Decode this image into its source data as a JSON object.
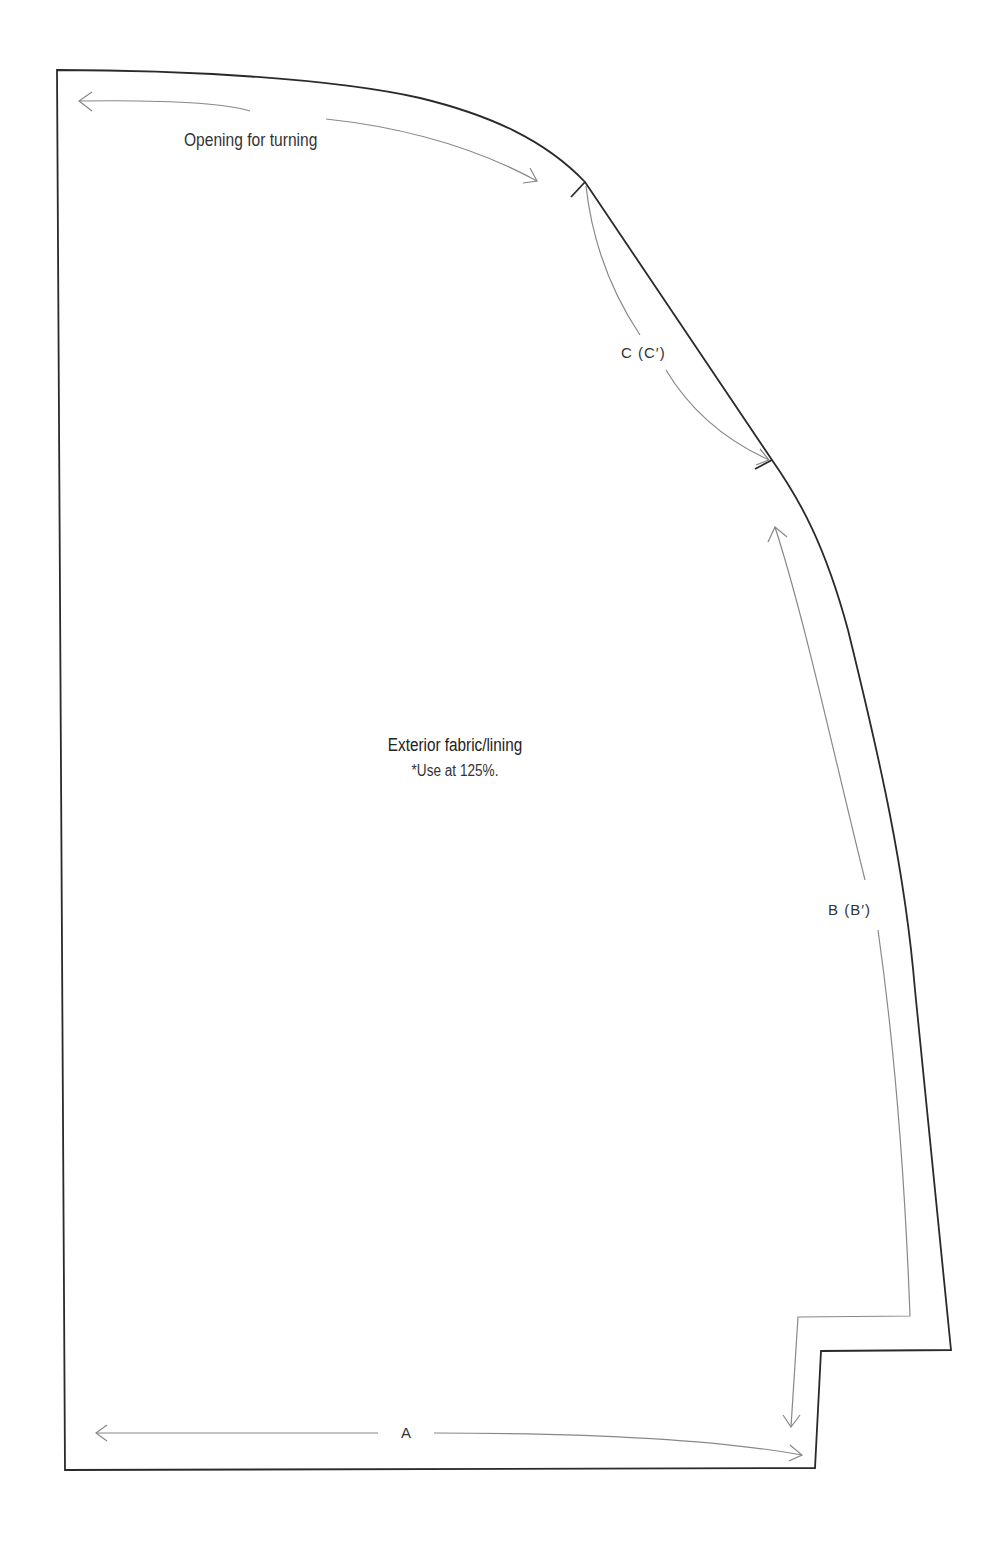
{
  "pattern_piece": {
    "title": "Exterior fabric/lining",
    "note": "*Use at 125%."
  },
  "annotations": {
    "opening": "Opening for turning",
    "seam_a": "A",
    "seam_b": "B (B′)",
    "seam_c": "C (C′)"
  },
  "colors": {
    "outline": "#2a2a2a",
    "guide_arrows": "#888888",
    "text": "#333333",
    "background": "#ffffff"
  }
}
